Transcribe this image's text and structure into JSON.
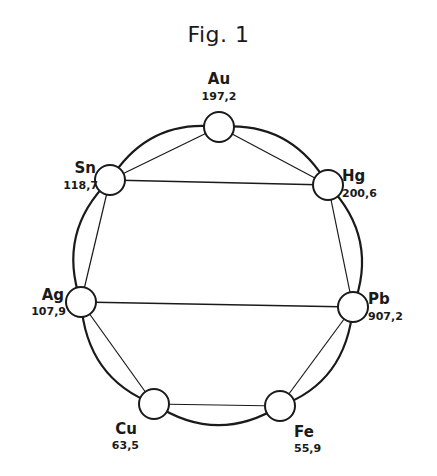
{
  "title": "Fig. 1",
  "diagram": {
    "type": "ring-network",
    "nodes": [
      {
        "id": "au",
        "symbol": "Au",
        "weight": "197,2"
      },
      {
        "id": "hg",
        "symbol": "Hg",
        "weight": "200,6"
      },
      {
        "id": "pb",
        "symbol": "Pb",
        "weight": "907,2"
      },
      {
        "id": "fe",
        "symbol": "Fe",
        "weight": "55,9"
      },
      {
        "id": "cu",
        "symbol": "Cu",
        "weight": "63,5"
      },
      {
        "id": "ag",
        "symbol": "Ag",
        "weight": "107,9"
      },
      {
        "id": "sn",
        "symbol": "Sn",
        "weight": "118,7"
      }
    ],
    "ring_order": [
      "au",
      "hg",
      "pb",
      "fe",
      "cu",
      "ag",
      "sn"
    ],
    "cross_links": [
      [
        "sn",
        "hg"
      ],
      [
        "ag",
        "pb"
      ]
    ]
  }
}
